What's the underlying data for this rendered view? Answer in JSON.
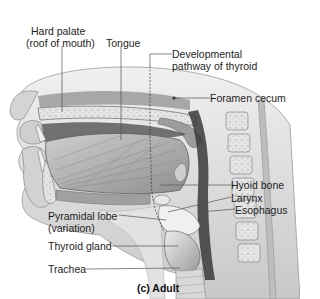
{
  "figure": {
    "caption": "(c) Adult",
    "labels": {
      "hard_palate_line1": "Hard palate",
      "hard_palate_line2": "(roof of mouth)",
      "tongue": "Tongue",
      "developmental_line1": "Developmental",
      "developmental_line2": "pathway of thyroid",
      "foramen_cecum": "Foramen cecum",
      "hyoid_bone": "Hyoid bone",
      "larynx": "Larynx",
      "esophagus": "Esophagus",
      "pyramidal_line1": "Pyramidal lobe",
      "pyramidal_line2": "(variation)",
      "thyroid_gland": "Thyroid gland",
      "trachea": "Trachea"
    }
  },
  "colors": {
    "background": "#ffffff",
    "skin": "#d9d9d9",
    "tissue_dark": "#6e6e6e",
    "tissue_mid": "#a8a8a8",
    "tissue_light": "#e6e6e6",
    "leader_line": "#555555"
  }
}
